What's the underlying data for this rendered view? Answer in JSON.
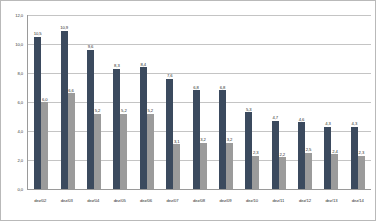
{
  "chart_data": {
    "type": "bar",
    "title": "",
    "xlabel": "",
    "ylabel": "",
    "ylim": [
      0.0,
      12.0
    ],
    "yticks": [
      "0,0",
      "2,0",
      "4,0",
      "6,0",
      "8,0",
      "10,0",
      "12,0"
    ],
    "ytick_values": [
      0.0,
      2.0,
      4.0,
      6.0,
      8.0,
      10.0,
      12.0
    ],
    "grid": true,
    "legend": "none",
    "decimal_separator": ",",
    "categories": [
      "dez/02",
      "dez/03",
      "dez/04",
      "dez/05",
      "dez/06",
      "dez/07",
      "dez/08",
      "dez/09",
      "dez/10",
      "dez/11",
      "dez/12",
      "dez/13",
      "dez/14"
    ],
    "series": [
      {
        "name": "series-1",
        "color": "#3b4a5e",
        "values": [
          10.5,
          10.9,
          9.6,
          8.3,
          8.4,
          7.6,
          6.8,
          6.8,
          5.3,
          4.7,
          4.6,
          4.3,
          4.3
        ],
        "labels": [
          "10,5",
          "10,9",
          "9,6",
          "8,3",
          "8,4",
          "7,6",
          "6,8",
          "6,8",
          "5,3",
          "4,7",
          "4,6",
          "4,3",
          "4,3"
        ]
      },
      {
        "name": "series-2",
        "color": "#9b9b9b",
        "values": [
          6.0,
          6.6,
          5.2,
          5.2,
          5.2,
          3.1,
          3.2,
          3.2,
          2.3,
          2.2,
          2.5,
          2.4,
          2.3
        ],
        "labels": [
          "6,0",
          "6,6",
          "5,2",
          "5,2",
          "5,2",
          "3,1",
          "3,2",
          "3,2",
          "2,3",
          "2,2",
          "2,5",
          "2,4",
          "2,3"
        ]
      }
    ]
  }
}
